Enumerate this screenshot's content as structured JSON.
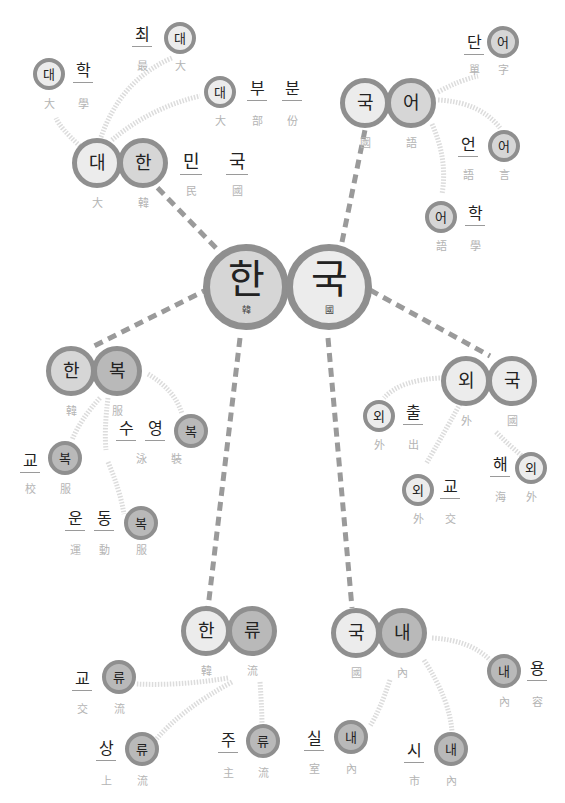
{
  "colors": {
    "ring": "#8f8f8f",
    "fill_light": "#ececec",
    "fill_mid": "#d6d6d6",
    "fill_dark": "#b9b9b9",
    "dash_link": "#9a9a9a",
    "soft_link": "#dcdcdc",
    "gloss": "#b4b4b4"
  },
  "center": {
    "syllables": [
      {
        "hangul": "한",
        "hanja": "韓"
      },
      {
        "hangul": "국",
        "hanja": "國"
      }
    ]
  },
  "nodes": [
    {
      "id": "daehan",
      "word": "대한민국",
      "hangul": [
        "대",
        "한",
        "민",
        "국"
      ],
      "hanja": [
        "大",
        "韓",
        "民",
        "國"
      ]
    },
    {
      "id": "gugeo",
      "word": "국어",
      "hangul": [
        "국",
        "어"
      ],
      "hanja": [
        "國",
        "語"
      ]
    },
    {
      "id": "hanbok",
      "word": "한복",
      "hangul": [
        "한",
        "복"
      ],
      "hanja": [
        "韓",
        "服"
      ]
    },
    {
      "id": "oeguk",
      "word": "외국",
      "hangul": [
        "외",
        "국"
      ],
      "hanja": [
        "外",
        "國"
      ]
    },
    {
      "id": "hallyu",
      "word": "한류",
      "hangul": [
        "한",
        "류"
      ],
      "hanja": [
        "韓",
        "流"
      ]
    },
    {
      "id": "gungnae",
      "word": "국내",
      "hangul": [
        "국",
        "내"
      ],
      "hanja": [
        "國",
        "內"
      ]
    }
  ],
  "leaves": [
    {
      "parent": "daehan",
      "word": "대학",
      "hangul": [
        "대",
        "학"
      ],
      "hanja": [
        "大",
        "學"
      ]
    },
    {
      "parent": "daehan",
      "word": "최대",
      "hangul": [
        "최",
        "대"
      ],
      "hanja": [
        "最",
        "大"
      ]
    },
    {
      "parent": "daehan",
      "word": "대부분",
      "hangul": [
        "대",
        "부",
        "분"
      ],
      "hanja": [
        "大",
        "部",
        "份"
      ]
    },
    {
      "parent": "gugeo",
      "word": "단어",
      "hangul": [
        "단",
        "어"
      ],
      "hanja": [
        "單",
        "字"
      ]
    },
    {
      "parent": "gugeo",
      "word": "언어",
      "hangul": [
        "언",
        "어"
      ],
      "hanja": [
        "語",
        "言"
      ]
    },
    {
      "parent": "gugeo",
      "word": "어학",
      "hangul": [
        "어",
        "학"
      ],
      "hanja": [
        "語",
        "學"
      ]
    },
    {
      "parent": "hanbok",
      "word": "교복",
      "hangul": [
        "교",
        "복"
      ],
      "hanja": [
        "校",
        "服"
      ]
    },
    {
      "parent": "hanbok",
      "word": "수영복",
      "hangul": [
        "수",
        "영",
        "복"
      ],
      "hanja": [
        "泳",
        "裝"
      ]
    },
    {
      "parent": "hanbok",
      "word": "운동복",
      "hangul": [
        "운",
        "동",
        "복"
      ],
      "hanja": [
        "運",
        "動",
        "服"
      ]
    },
    {
      "parent": "oeguk",
      "word": "외출",
      "hangul": [
        "외",
        "출"
      ],
      "hanja": [
        "外",
        "出"
      ]
    },
    {
      "parent": "oeguk",
      "word": "외교",
      "hangul": [
        "외",
        "교"
      ],
      "hanja": [
        "外",
        "交"
      ]
    },
    {
      "parent": "oeguk",
      "word": "해외",
      "hangul": [
        "해",
        "외"
      ],
      "hanja": [
        "海",
        "外"
      ]
    },
    {
      "parent": "hallyu",
      "word": "교류",
      "hangul": [
        "교",
        "류"
      ],
      "hanja": [
        "交",
        "流"
      ]
    },
    {
      "parent": "hallyu",
      "word": "상류",
      "hangul": [
        "상",
        "류"
      ],
      "hanja": [
        "上",
        "流"
      ]
    },
    {
      "parent": "hallyu",
      "word": "주류",
      "hangul": [
        "주",
        "류"
      ],
      "hanja": [
        "主",
        "流"
      ]
    },
    {
      "parent": "gungnae",
      "word": "내용",
      "hangul": [
        "내",
        "용"
      ],
      "hanja": [
        "內",
        "容"
      ]
    },
    {
      "parent": "gungnae",
      "word": "실내",
      "hangul": [
        "실",
        "내"
      ],
      "hanja": [
        "室",
        "內"
      ]
    },
    {
      "parent": "gungnae",
      "word": "시내",
      "hangul": [
        "시",
        "내"
      ],
      "hanja": [
        "市",
        "內"
      ]
    }
  ]
}
